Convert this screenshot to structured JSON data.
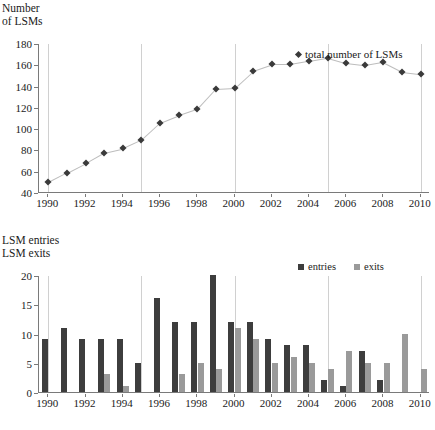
{
  "figure": {
    "top_panel": {
      "y_axis_title": "Number\nof LSMs",
      "legend": [
        {
          "label": "total number of LSMs",
          "marker": "diamond-marker-icon",
          "color": "#3a3a3a"
        }
      ]
    },
    "bottom_panel": {
      "y_axis_title": "LSM entries\nLSM exits",
      "legend": [
        {
          "label": "entries",
          "swatch": "entries-swatch-icon",
          "color": "#3d3d3d"
        },
        {
          "label": "exits",
          "swatch": "exits-swatch-icon",
          "color": "#9a9a9a"
        }
      ]
    }
  },
  "chart_data": [
    {
      "type": "line",
      "title": "",
      "xlabel": "",
      "ylabel": "Number of LSMs",
      "x": [
        1990,
        1991,
        1992,
        1993,
        1994,
        1995,
        1996,
        1997,
        1998,
        1999,
        2000,
        2001,
        2002,
        2003,
        2004,
        2005,
        2006,
        2007,
        2008,
        2009,
        2010
      ],
      "categories": [
        "1990",
        "1991",
        "1992",
        "1993",
        "1994",
        "1995",
        "1996",
        "1997",
        "1998",
        "1999",
        "2000",
        "2001",
        "2002",
        "2003",
        "2004",
        "2005",
        "2006",
        "2007",
        "2008",
        "2009",
        "2010"
      ],
      "series": [
        {
          "name": "total number of LSMs",
          "values": [
            50,
            59,
            68,
            78,
            82,
            90,
            106,
            113,
            119,
            138,
            139,
            155,
            161,
            161,
            164,
            167,
            162,
            160,
            163,
            154,
            152
          ],
          "color": "#3a3a3a",
          "marker": "diamond"
        }
      ],
      "ylim": [
        40,
        180
      ],
      "yticks": [
        40,
        60,
        80,
        100,
        120,
        140,
        160,
        180
      ],
      "xticks": [
        1990,
        1992,
        1994,
        1996,
        1998,
        2000,
        2002,
        2004,
        2006,
        2008,
        2010
      ],
      "xtick_labels": [
        "1990",
        "1992",
        "1994",
        "1996",
        "1998",
        "2000",
        "2002",
        "2004",
        "2006",
        "2008",
        "2010"
      ],
      "grid": "vertical-major",
      "legend_position": "top-right"
    },
    {
      "type": "bar",
      "title": "",
      "xlabel": "",
      "ylabel": "LSM entries / LSM exits",
      "categories": [
        "1990",
        "1991",
        "1992",
        "1993",
        "1994",
        "1995",
        "1996",
        "1997",
        "1998",
        "1999",
        "2000",
        "2001",
        "2002",
        "2003",
        "2004",
        "2005",
        "2006",
        "2007",
        "2008",
        "2009",
        "2010"
      ],
      "series": [
        {
          "name": "entries",
          "color": "#3d3d3d",
          "values": [
            9,
            11,
            9,
            9,
            9,
            5,
            16,
            12,
            12,
            20,
            12,
            12,
            9,
            8,
            8,
            2,
            1,
            7,
            2,
            0,
            0
          ]
        },
        {
          "name": "exits",
          "color": "#9a9a9a",
          "values": [
            0,
            0,
            0,
            3,
            1,
            0,
            0,
            3,
            5,
            4,
            11,
            9,
            5,
            6,
            5,
            4,
            7,
            5,
            5,
            10,
            4
          ]
        }
      ],
      "ylim": [
        0,
        20
      ],
      "yticks": [
        0,
        5,
        10,
        15,
        20
      ],
      "xticks": [
        1990,
        1992,
        1994,
        1996,
        1998,
        2000,
        2002,
        2004,
        2006,
        2008,
        2010
      ],
      "xtick_labels": [
        "1990",
        "1992",
        "1994",
        "1996",
        "1998",
        "2000",
        "2002",
        "2004",
        "2006",
        "2008",
        "2010"
      ],
      "grid": "vertical-major",
      "legend_position": "top-right"
    }
  ]
}
